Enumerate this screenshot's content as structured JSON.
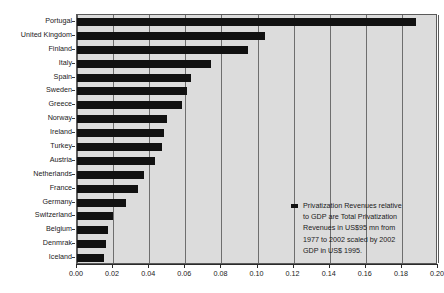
{
  "chart_data": {
    "type": "bar",
    "orientation": "horizontal",
    "title": "",
    "xlabel": "",
    "ylabel": "",
    "xlim": [
      0.0,
      0.2
    ],
    "xticks": [
      "0.00",
      "0.02",
      "0.04",
      "0.06",
      "0.08",
      "0.10",
      "0.12",
      "0.14",
      "0.16",
      "0.18",
      "0.20"
    ],
    "xtick_values": [
      0.0,
      0.02,
      0.04,
      0.06,
      0.08,
      0.1,
      0.12,
      0.14,
      0.16,
      0.18,
      0.2
    ],
    "grid": true,
    "grid_axis": "x",
    "legend_position": "inside-lower-right",
    "bar_color": "#111111",
    "plot_background": "#dcdcdc",
    "categories": [
      "Portugal",
      "United Kingdom",
      "Finland",
      "Italy",
      "Spain",
      "Sweden",
      "Greece",
      "Norway",
      "Ireland",
      "Turkey",
      "Austria",
      "Netherlands",
      "France",
      "Germany",
      "Switzerland",
      "Belgium",
      "Denmrak",
      "Iceland"
    ],
    "values": [
      0.188,
      0.104,
      0.095,
      0.074,
      0.063,
      0.061,
      0.058,
      0.05,
      0.048,
      0.047,
      0.043,
      0.037,
      0.034,
      0.027,
      0.02,
      0.017,
      0.016,
      0.015
    ],
    "series": [
      {
        "name": "Privatization Revenues relative to GDP",
        "values": [
          0.188,
          0.104,
          0.095,
          0.074,
          0.063,
          0.061,
          0.058,
          0.05,
          0.048,
          0.047,
          0.043,
          0.037,
          0.034,
          0.027,
          0.02,
          0.017,
          0.016,
          0.015
        ]
      }
    ]
  },
  "legend": {
    "marker_color": "#111111",
    "lines": [
      "Privatization Revenues relative",
      "to GDP are Total Privatization",
      "Revenues in US$95 mn from",
      "1977 to 2002 scaled by 2002",
      "GDP in US$ 1995."
    ],
    "full_text": "Privatization Revenues relative to GDP are Total Privatization Revenues in US$95 mn from 1977 to 2002 scaled by 2002 GDP in US$ 1995."
  }
}
